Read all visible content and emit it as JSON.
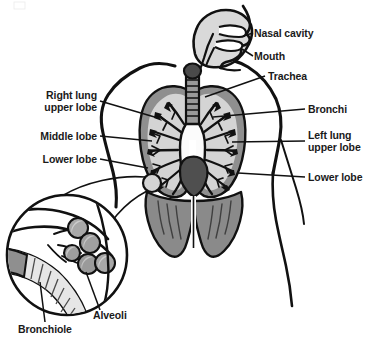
{
  "diagram": {
    "type": "anatomical-illustration",
    "background_color": "#ffffff",
    "text_color": "#1a1a1a",
    "stroke_color": "#111111",
    "palette": {
      "body_outline": "#111111",
      "head_fill": "#d9d9d9",
      "lung_fill": "#d4d4d4",
      "lung_border": "#8f8f8f",
      "trachea_fill": "#9a9a9a",
      "larynx_fill": "#4a4a4a",
      "heart_fill": "#4f4f4f",
      "diaphragm_fill": "#8a8a8a",
      "bronchi_fill": "#111111",
      "airway_fill": "#fbfbfb",
      "alveoli_fill": "#9e9e9e",
      "bronchiole_fill": "#8f8f8f"
    }
  },
  "labels": {
    "nasal_cavity": "Nasal cavity",
    "mouth": "Mouth",
    "trachea": "Trachea",
    "bronchi": "Bronchi",
    "left_lung_upper_lobe_line1": "Left lung",
    "left_lung_upper_lobe_line2": "upper lobe",
    "lower_lobe_right_side": "Lower lobe",
    "right_lung_upper_lobe_line1": "Right lung",
    "right_lung_upper_lobe_line2": "upper lobe",
    "middle_lobe": "Middle lobe",
    "lower_lobe_left_side": "Lower lobe",
    "alveoli": "Alveoli",
    "bronchiole": "Bronchiole"
  },
  "parts": [
    {
      "name": "nasal-cavity",
      "side": "right"
    },
    {
      "name": "mouth",
      "side": "right"
    },
    {
      "name": "trachea",
      "side": "right"
    },
    {
      "name": "bronchi",
      "side": "right"
    },
    {
      "name": "left-lung-upper-lobe",
      "side": "right"
    },
    {
      "name": "left-lung-lower-lobe",
      "side": "right"
    },
    {
      "name": "right-lung-upper-lobe",
      "side": "left"
    },
    {
      "name": "right-lung-middle-lobe",
      "side": "left"
    },
    {
      "name": "right-lung-lower-lobe",
      "side": "left"
    },
    {
      "name": "alveoli",
      "side": "inset"
    },
    {
      "name": "bronchiole",
      "side": "inset"
    }
  ],
  "inset": {
    "name": "magnified-alveoli-inset",
    "alveoli_count": 5
  }
}
